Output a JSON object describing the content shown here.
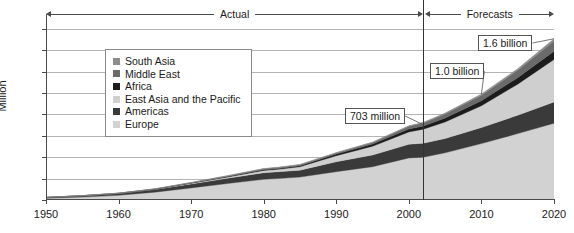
{
  "chart_data": {
    "type": "area",
    "stacked": true,
    "title": "",
    "xlabel": "",
    "ylabel": "Million",
    "xlim": [
      1950,
      2020
    ],
    "ylim": [
      0,
      1700
    ],
    "yticks": [
      0,
      200,
      400,
      600,
      800,
      1000,
      1200,
      1400,
      1600
    ],
    "xticks": [
      1950,
      1960,
      1970,
      1980,
      1990,
      2000,
      2010,
      2020
    ],
    "grid": true,
    "legend_position": "inside-upper-left",
    "x": [
      1950,
      1955,
      1960,
      1965,
      1970,
      1975,
      1980,
      1982,
      1985,
      1990,
      1995,
      2000,
      2002,
      2005,
      2010,
      2015,
      2020
    ],
    "series": [
      {
        "name": "Europe",
        "color": "#d2d2d2",
        "values": [
          16,
          27,
          44,
          73,
          113,
          154,
          193,
          200,
          214,
          265,
          311,
          393,
          400,
          441,
          527,
          620,
          717
        ]
      },
      {
        "name": "Americas",
        "color": "#3a3a3a",
        "values": [
          8,
          12,
          17,
          25,
          37,
          50,
          62,
          64,
          65,
          93,
          109,
          128,
          131,
          134,
          150,
          172,
          199
        ]
      },
      {
        "name": "East Asia and the Pacific",
        "color": "#cfcfcf",
        "values": [
          0.2,
          0.5,
          1,
          2,
          6,
          10,
          21,
          23,
          32,
          56,
          82,
          115,
          131,
          154,
          204,
          290,
          397
        ]
      },
      {
        "name": "Africa",
        "color": "#1c1c1c",
        "values": [
          0.5,
          0.8,
          1,
          2,
          3,
          5,
          7,
          8,
          9,
          15,
          20,
          27,
          29,
          37,
          47,
          61,
          77
        ]
      },
      {
        "name": "Middle East",
        "color": "#6a6a6a",
        "values": [
          0.2,
          0.4,
          0.6,
          1.5,
          3,
          6,
          8,
          8,
          9,
          10,
          14,
          25,
          28,
          38,
          51,
          69,
          96
        ]
      },
      {
        "name": "South Asia",
        "color": "#8c8c8c",
        "values": [
          0.2,
          0.3,
          0.5,
          1,
          1.5,
          2.5,
          3,
          3,
          3.5,
          4,
          5,
          6,
          6.5,
          8,
          11,
          15,
          20
        ]
      }
    ],
    "totals": [
      25,
      41,
      64,
      104,
      164,
      228,
      294,
      306,
      333,
      443,
      541,
      694,
      703,
      812,
      990,
      1227,
      1506
    ],
    "annotations": [
      {
        "label": "703 million",
        "x": 2002,
        "y": 703
      },
      {
        "label": "1.0 billion",
        "x": 2010,
        "y": 990
      },
      {
        "label": "1.6 billion",
        "x": 2020,
        "y": 1506
      }
    ],
    "period_divider": {
      "x": 2002
    },
    "periods": [
      {
        "label": "Actual",
        "from": 1950,
        "to": 2002
      },
      {
        "label": "Forecasts",
        "from": 2002,
        "to": 2020
      }
    ]
  },
  "axis": {
    "ylabel": "Million",
    "yticks": [
      "1600",
      "1400",
      "1200",
      "1000",
      "800",
      "600",
      "400",
      "200",
      "0"
    ],
    "xticks": [
      "1950",
      "1960",
      "1970",
      "1980",
      "1990",
      "2000",
      "2010",
      "2020"
    ]
  },
  "legend": {
    "items": [
      {
        "label": "South Asia",
        "color": "#8c8c8c"
      },
      {
        "label": "Middle East",
        "color": "#6a6a6a"
      },
      {
        "label": "Africa",
        "color": "#1c1c1c"
      },
      {
        "label": "East Asia and the Pacific",
        "color": "#cfcfcf"
      },
      {
        "label": "Americas",
        "color": "#3a3a3a"
      },
      {
        "label": "Europe",
        "color": "#d2d2d2"
      }
    ]
  },
  "periods": {
    "actual": "Actual",
    "forecasts": "Forecasts"
  },
  "callouts": {
    "a": "703 million",
    "b": "1.0 billion",
    "c": "1.6 billion"
  }
}
